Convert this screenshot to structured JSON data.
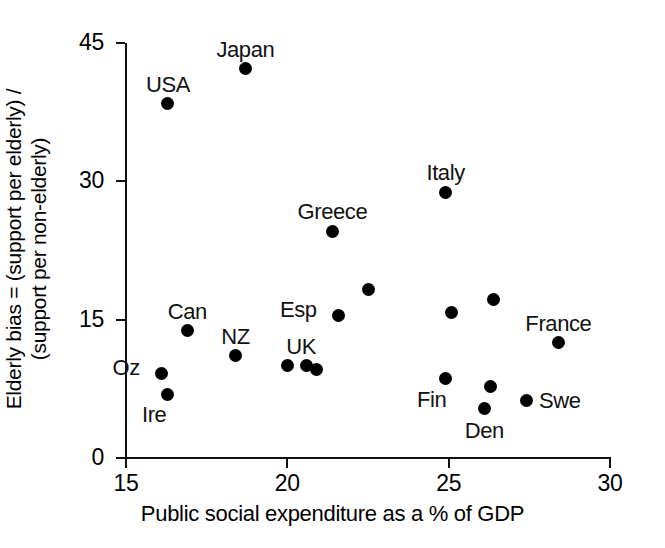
{
  "chart_data": {
    "type": "scatter",
    "title": "",
    "xlabel": "Public social expenditure as a % of GDP",
    "ylabel_line1": "Elderly bias = (support per elderly) /",
    "ylabel_line2": "(support per non-elderly)",
    "xlim": [
      15,
      30
    ],
    "ylim": [
      0,
      45
    ],
    "xticks": [
      "15",
      "20",
      "25",
      "30"
    ],
    "xtick_values": [
      15,
      20,
      25,
      30
    ],
    "yticks": [
      "0",
      "15",
      "30",
      "45"
    ],
    "ytick_values": [
      0,
      15,
      30,
      45
    ],
    "grid": false,
    "legend": "none",
    "marker": "filled-circle",
    "marker_color": "#000000",
    "points": [
      {
        "label": "Japan",
        "x": 18.7,
        "y": 42.2,
        "label_pos": "above"
      },
      {
        "label": "USA",
        "x": 16.3,
        "y": 38.4,
        "label_pos": "above"
      },
      {
        "label": "Italy",
        "x": 24.9,
        "y": 28.8,
        "label_pos": "above"
      },
      {
        "label": "Greece",
        "x": 21.4,
        "y": 24.6,
        "label_pos": "above"
      },
      {
        "label": "",
        "x": 22.5,
        "y": 18.3,
        "label_pos": "none"
      },
      {
        "label": "",
        "x": 26.4,
        "y": 17.2,
        "label_pos": "none"
      },
      {
        "label": "",
        "x": 25.1,
        "y": 15.8,
        "label_pos": "none"
      },
      {
        "label": "Esp",
        "x": 21.6,
        "y": 15.5,
        "label_pos": "upper-left"
      },
      {
        "label": "Can",
        "x": 16.9,
        "y": 13.8,
        "label_pos": "above"
      },
      {
        "label": "France",
        "x": 28.4,
        "y": 12.5,
        "label_pos": "above"
      },
      {
        "label": "NZ",
        "x": 18.4,
        "y": 11.1,
        "label_pos": "above"
      },
      {
        "label": "UK",
        "x": 20.0,
        "y": 10.0,
        "label_pos": "above-right"
      },
      {
        "label": "",
        "x": 20.6,
        "y": 10.0,
        "label_pos": "none"
      },
      {
        "label": "",
        "x": 20.9,
        "y": 9.6,
        "label_pos": "none"
      },
      {
        "label": "Oz",
        "x": 16.1,
        "y": 9.2,
        "label_pos": "upper-left"
      },
      {
        "label": "Fin",
        "x": 24.9,
        "y": 8.6,
        "label_pos": "below-left"
      },
      {
        "label": "",
        "x": 26.3,
        "y": 7.7,
        "label_pos": "none"
      },
      {
        "label": "Ire",
        "x": 16.3,
        "y": 6.9,
        "label_pos": "below-left"
      },
      {
        "label": "Swe",
        "x": 27.4,
        "y": 6.2,
        "label_pos": "right"
      },
      {
        "label": "Den",
        "x": 26.1,
        "y": 5.4,
        "label_pos": "below"
      }
    ]
  }
}
